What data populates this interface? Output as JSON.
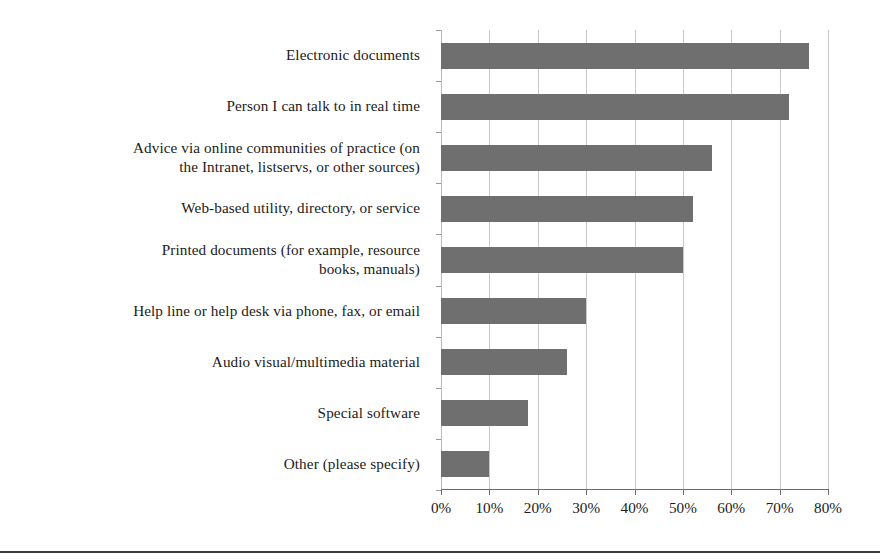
{
  "chart_data": {
    "type": "bar",
    "orientation": "horizontal",
    "title": "",
    "subtitle": "",
    "xlabel": "",
    "ylabel": "",
    "xlim": [
      0,
      80
    ],
    "ylim": null,
    "grid": true,
    "legend": null,
    "legend_position": "none",
    "bar_color": "#6f6f6f",
    "gridline_color": "#c9c9c9",
    "axis_color": "#6b6b6b",
    "value_suffix": "%",
    "categories": [
      "Electronic documents",
      "Person I can talk to in real time",
      "Advice via online communities of practice (on the Intranet, listservs, or other sources)",
      "Web-based utility, directory, or service",
      "Printed documents (for example, resource books, manuals)",
      "Help line or help desk via phone, fax, or email",
      "Audio visual/multimedia material",
      "Special software",
      "Other (please specify)"
    ],
    "category_lines": [
      [
        "Electronic documents"
      ],
      [
        "Person I can talk to in real time"
      ],
      [
        "Advice via online communities of practice (on",
        "the Intranet, listservs, or other sources)"
      ],
      [
        "Web-based utility, directory, or service"
      ],
      [
        "Printed documents (for example, resource",
        "books, manuals)"
      ],
      [
        "Help line or help desk via phone, fax, or email"
      ],
      [
        "Audio visual/multimedia material"
      ],
      [
        "Special software"
      ],
      [
        "Other (please specify)"
      ]
    ],
    "values": [
      76,
      72,
      56,
      52,
      50,
      30,
      26,
      18,
      10
    ],
    "xticks": [
      0,
      10,
      20,
      30,
      40,
      50,
      60,
      70,
      80
    ],
    "xtick_labels": [
      "0%",
      "10%",
      "20%",
      "30%",
      "40%",
      "50%",
      "60%",
      "70%",
      "80%"
    ]
  }
}
